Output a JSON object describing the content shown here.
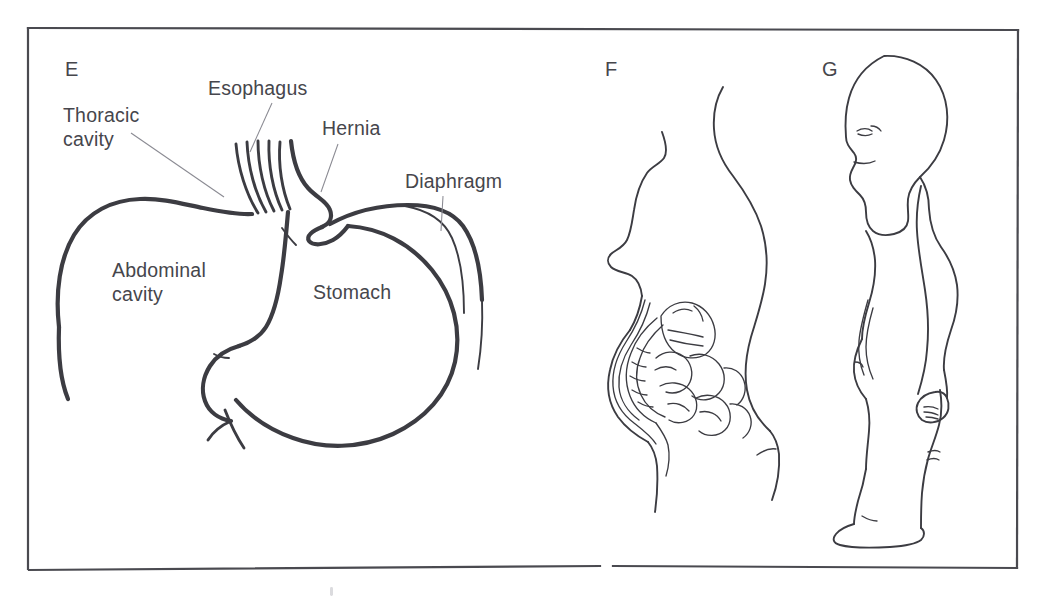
{
  "figure": {
    "background_color": "#ffffff",
    "ink_color": "#3c3c42",
    "label_color": "#46464c",
    "leader_color": "#8a8a92",
    "frame_color": "#4a4a50"
  },
  "panels": [
    {
      "id": "panel-e",
      "letter": "E",
      "letter_x": 65,
      "letter_y": 76,
      "caption": "Hiatal hernia: stomach protruding through the diaphragm into the thoracic cavity"
    },
    {
      "id": "panel-f",
      "letter": "F",
      "letter_x": 605,
      "letter_y": 76,
      "caption": "Lateral torso profile showing distended abdomen with intestines"
    },
    {
      "id": "panel-g",
      "letter": "G",
      "letter_x": 822,
      "letter_y": 76,
      "caption": "Infant standing in lateral profile with protuberant abdomen"
    }
  ],
  "labels": [
    {
      "id": "label-thoracic-cavity",
      "name": "thoracic-cavity",
      "lines": [
        "Thoracic",
        "cavity"
      ],
      "x": 63,
      "y": 122,
      "line_height": 24,
      "leader": {
        "x1": 131,
        "y1": 133,
        "x2": 224,
        "y2": 197
      }
    },
    {
      "id": "label-esophagus",
      "name": "esophagus",
      "lines": [
        "Esophagus"
      ],
      "x": 208,
      "y": 95,
      "line_height": 24,
      "leader": {
        "x1": 272,
        "y1": 103,
        "x2": 250,
        "y2": 152
      }
    },
    {
      "id": "label-hernia",
      "name": "hernia",
      "lines": [
        "Hernia"
      ],
      "x": 322,
      "y": 135,
      "line_height": 24,
      "leader": {
        "x1": 338,
        "y1": 144,
        "x2": 321,
        "y2": 192
      }
    },
    {
      "id": "label-diaphragm",
      "name": "diaphragm",
      "lines": [
        "Diaphragm"
      ],
      "x": 405,
      "y": 188,
      "line_height": 24,
      "leader": {
        "x1": 443,
        "y1": 196,
        "x2": 441,
        "y2": 231
      }
    },
    {
      "id": "label-abdominal-cavity",
      "name": "abdominal-cavity",
      "lines": [
        "Abdominal",
        "cavity"
      ],
      "x": 112,
      "y": 277,
      "line_height": 24,
      "leader": null
    },
    {
      "id": "label-stomach",
      "name": "stomach",
      "lines": [
        "Stomach"
      ],
      "x": 313,
      "y": 299,
      "line_height": 24,
      "leader": null
    }
  ],
  "frame": {
    "left": 28,
    "top": 27,
    "right": 1018,
    "bottom": 570,
    "bottom_gap_start": 600,
    "bottom_gap_end": 613
  },
  "artifacts": [
    {
      "id": "speck-bottom",
      "x": 330,
      "y": 590,
      "w": 3,
      "h": 9
    }
  ]
}
